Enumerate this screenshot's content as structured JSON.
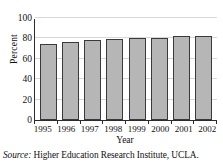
{
  "chart_data": {
    "type": "bar",
    "title": "",
    "subtitle": "",
    "xlabel": "Year",
    "ylabel": "Percent",
    "categories": [
      "1995",
      "1996",
      "1997",
      "1998",
      "1999",
      "2000",
      "2001",
      "2002"
    ],
    "values": [
      75,
      76,
      78,
      79,
      80,
      80,
      82,
      82
    ],
    "ylim": [
      0,
      100
    ],
    "yticks": [
      0,
      20,
      40,
      60,
      80,
      100
    ],
    "ytick_labels": [
      "0",
      "20",
      "40",
      "60",
      "80",
      "100"
    ],
    "grid": true,
    "grid_axis": "y",
    "legend": false,
    "legend_position": "none",
    "bar_fill_color": "#b6b6b6",
    "bar_edge_color": "#3a3a3a",
    "gridline_color": "#d8d8d8",
    "axis_color": "#2b2b2b"
  },
  "source": {
    "label": "Source:",
    "text": "Higher Education Research Institute, UCLA."
  }
}
